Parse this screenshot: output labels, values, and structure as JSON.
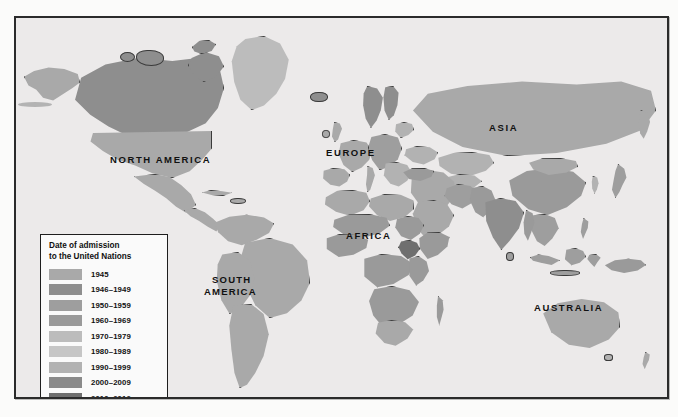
{
  "figure": {
    "type": "world-map",
    "subject": "Date of admission to the United Nations",
    "frame": {
      "border_color": "#2b2b2b",
      "ocean_color": "#eceaea"
    }
  },
  "legend": {
    "title_line1": "Date of admission",
    "title_line2": "to the United Nations",
    "items": [
      {
        "label": "1945",
        "color": "#a9a9a9"
      },
      {
        "label": "1946–1949",
        "color": "#8e8e8e"
      },
      {
        "label": "1950–1959",
        "color": "#9e9e9e"
      },
      {
        "label": "1960–1969",
        "color": "#9a9a9a"
      },
      {
        "label": "1970–1979",
        "color": "#bcbcbc"
      },
      {
        "label": "1980–1989",
        "color": "#c6c6c6"
      },
      {
        "label": "1990–1999",
        "color": "#b2b2b2"
      },
      {
        "label": "2000–2009",
        "color": "#8a8a8a"
      },
      {
        "label": "2010–2012",
        "color": "#6f6f6f"
      }
    ]
  },
  "continent_labels": [
    {
      "name": "north-america",
      "text": "NORTH AMERICA"
    },
    {
      "name": "south-america-line1",
      "text": "SOUTH"
    },
    {
      "name": "south-america-line2",
      "text": "AMERICA"
    },
    {
      "name": "europe",
      "text": "EUROPE"
    },
    {
      "name": "africa",
      "text": "AFRICA"
    },
    {
      "name": "asia",
      "text": "ASIA"
    },
    {
      "name": "australia",
      "text": "AUSTRALIA"
    }
  ],
  "bleed_text": [
    {
      "text": "the United"
    },
    {
      "text": "countries"
    },
    {
      "text": "members"
    },
    {
      "text": "nations of"
    },
    {
      "text": "the world"
    }
  ]
}
